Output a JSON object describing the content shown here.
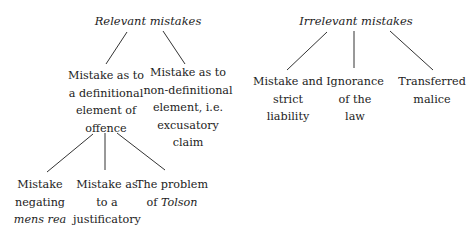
{
  "diagram": {
    "relevant": {
      "title": "Relevant mistakes",
      "definitional": [
        "Mistake as to",
        "a definitional",
        "element of",
        "offence"
      ],
      "non_definitional": [
        "Mistake as to",
        "non-definitional",
        "element, i.e.",
        "excusatory",
        "claim"
      ],
      "children": {
        "negating": {
          "l1": "Mistake",
          "l2": "negating",
          "l3_italic": "mens rea"
        },
        "justificatory": [
          "Mistake as",
          "to a",
          "justificatory",
          "claim"
        ],
        "tolson": {
          "l1": "The problem",
          "l2_prefix": "of ",
          "l2_italic": "Tolson"
        }
      }
    },
    "irrelevant": {
      "title": "Irrelevant mistakes",
      "strict": [
        "Mistake and",
        "strict",
        "liability"
      ],
      "ignorance": [
        "Ignorance",
        "of the",
        "law"
      ],
      "transferred": [
        "Transferred",
        "malice"
      ]
    }
  }
}
